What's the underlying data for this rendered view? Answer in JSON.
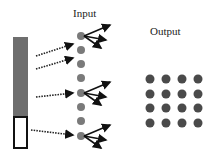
{
  "labels": {
    "input": "Input",
    "output": "Output"
  },
  "colors": {
    "bar": "#6e6e6e",
    "dot": "#7a7a7a",
    "output_dot": "#4a4a4a",
    "arrow": "#111111"
  },
  "input_layer": {
    "dot_count": 8,
    "arrow_sources": [
      1,
      2,
      4,
      8
    ],
    "fanout_dots": [
      1,
      4,
      8
    ]
  },
  "output_layer": {
    "rows": 4,
    "cols": 4
  }
}
